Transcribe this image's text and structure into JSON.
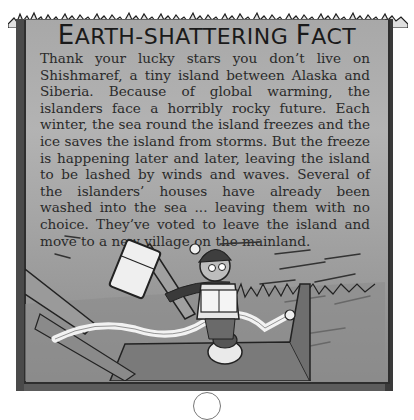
{
  "box": {
    "title": "Earth-shattering Fact",
    "title_first_letter": "E",
    "title_rest": "ARTH-SHATTERING ",
    "title_second_big": "F",
    "title_tail": "ACT",
    "paragraph": "Thank your lucky stars you don’t live on Shishmaref, a tiny island between Alaska and Siberia. Because of global warming, the islanders face a horribly rocky future. Each winter, the sea round the island freezes and the ice saves the island from storms. But the freeze is happening later and later, leaving the island to be lashed by winds and waves. Several of the islanders’ houses have already been washed into the sea ... leaving them with no choice. They’ve voted to leave the island and move to a new village on the mainland."
  },
  "illustration": {
    "description": "Cartoon boy in a bobble hat and scarf reading a book while a storm blows away a fridge, planks and toilet paper; a toilet sits on a floor in the foreground"
  },
  "colors": {
    "panel": "#a8a8a8",
    "frame": "#3a3a3a",
    "text": "#2a2a2a"
  }
}
